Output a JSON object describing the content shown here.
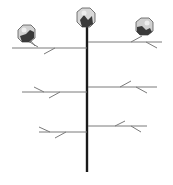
{
  "diagram": {
    "parts": {
      "main_stem": "main-stem",
      "bolls": [
        "top-boll",
        "upper-left-boll",
        "upper-right-boll"
      ],
      "branches": [
        "upper-left-branch",
        "upper-right-branch",
        "middle-left-branch",
        "middle-right-branch",
        "lower-left-branch",
        "lower-right-branch"
      ]
    },
    "colors": {
      "stem": "#1a1a1a",
      "branch": "#7a7a7a",
      "boll_light": "#d8d8d8",
      "boll_dark": "#3a3a3a",
      "background": "#ffffff"
    }
  }
}
